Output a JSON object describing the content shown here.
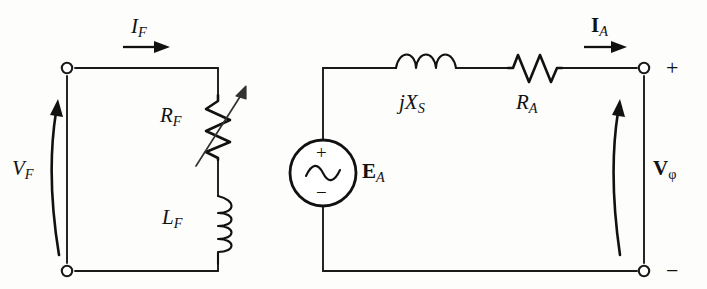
{
  "figure": {
    "type": "circuit-schematic",
    "background_color": "#fdfdfc",
    "line_color": "#111111"
  },
  "field_circuit": {
    "name": "field-circuit",
    "current_label": {
      "symbol": "I",
      "subscript": "F",
      "text": "I_F",
      "style": "italic"
    },
    "voltage_label": {
      "symbol": "V",
      "subscript": "F",
      "text": "V_F",
      "style": "italic"
    },
    "components": [
      {
        "id": "variable-resistor",
        "symbol": "R",
        "subscript": "F",
        "text": "R_F",
        "kind": "variable-resistor",
        "orientation": "vertical",
        "style": "italic"
      },
      {
        "id": "inductor",
        "symbol": "L",
        "subscript": "F",
        "text": "L_F",
        "kind": "inductor",
        "orientation": "vertical",
        "coils": 4,
        "style": "italic"
      }
    ],
    "terminals": [
      {
        "id": "field-terminal-top",
        "marker": "open-circle",
        "sign": ""
      },
      {
        "id": "field-terminal-bottom",
        "marker": "open-circle",
        "sign": ""
      }
    ]
  },
  "armature_circuit": {
    "name": "armature-circuit",
    "current_label": {
      "symbol": "I",
      "subscript": "A",
      "text": "I_A",
      "style": "bold"
    },
    "voltage_label": {
      "symbol": "V",
      "subscript": "φ",
      "text": "V_φ",
      "style": "bold"
    },
    "source": {
      "id": "ac-voltage-source",
      "symbol": "E",
      "subscript": "A",
      "text": "E_A",
      "style": "bold",
      "kind": "ac-source",
      "plus": "+",
      "minus": "−"
    },
    "components": [
      {
        "id": "synchronous-reactance",
        "text": "jX_S",
        "prefix": "j",
        "symbol": "X",
        "subscript": "S",
        "kind": "inductor",
        "orientation": "horizontal",
        "coils": 3,
        "style": "italic"
      },
      {
        "id": "armature-resistance",
        "symbol": "R",
        "subscript": "A",
        "text": "R_A",
        "kind": "resistor",
        "orientation": "horizontal",
        "style": "italic"
      }
    ],
    "terminals": [
      {
        "id": "armature-terminal-top",
        "marker": "open-circle",
        "sign": "+"
      },
      {
        "id": "armature-terminal-bottom",
        "marker": "open-circle",
        "sign": "−"
      }
    ]
  },
  "labels": {
    "i_f": "I",
    "i_f_sub": "F",
    "v_f": "V",
    "v_f_sub": "F",
    "r_f": "R",
    "r_f_sub": "F",
    "l_f": "L",
    "l_f_sub": "F",
    "jx_s": "jX",
    "jx_s_sub": "S",
    "r_a": "R",
    "r_a_sub": "A",
    "e_a": "E",
    "e_a_sub": "A",
    "i_a": "I",
    "i_a_sub": "A",
    "v_phi": "V",
    "v_phi_sub": "φ",
    "plus_sign": "+",
    "minus_sign": "−",
    "source_plus": "+",
    "source_minus": "−"
  }
}
